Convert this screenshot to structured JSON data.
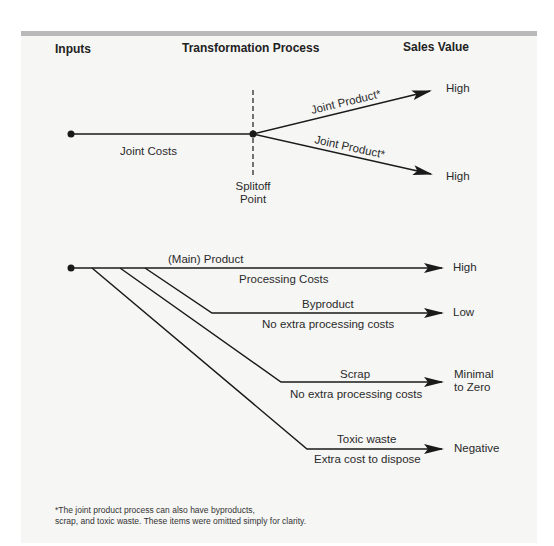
{
  "headers": {
    "inputs": "Inputs",
    "process": "Transformation Process",
    "sales_value": "Sales Value"
  },
  "joint_section": {
    "joint_costs": "Joint Costs",
    "splitoff_line1": "Splitoff",
    "splitoff_line2": "Point",
    "branches": [
      {
        "label": "Joint Product*",
        "value": "High"
      },
      {
        "label": "Joint Product*",
        "value": "High"
      }
    ]
  },
  "product_section": {
    "rows": [
      {
        "above": "(Main) Product",
        "below": "Processing Costs",
        "value_line1": "High",
        "value_line2": ""
      },
      {
        "above": "Byproduct",
        "below": "No extra processing costs",
        "value_line1": "Low",
        "value_line2": ""
      },
      {
        "above": "Scrap",
        "below": "No extra processing costs",
        "value_line1": "Minimal",
        "value_line2": "to Zero"
      },
      {
        "above": "Toxic waste",
        "below": "Extra cost to dispose",
        "value_line1": "Negative",
        "value_line2": ""
      }
    ]
  },
  "footnote": {
    "line1": "*The joint product process can also have byproducts,",
    "line2": "scrap, and toxic waste. These items were omitted simply for clarity."
  },
  "colors": {
    "panel": "#f6f6f5",
    "topbar": "#b9b9b9",
    "ink": "#1a1a1a"
  }
}
